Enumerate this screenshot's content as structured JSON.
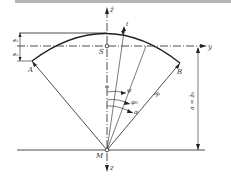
{
  "diagram": {
    "type": "arch-cross-section",
    "colors": {
      "line": "#222222",
      "top_bar": "#b5b5b5",
      "background": "#ffffff"
    },
    "labels": {
      "z_top": "z̄",
      "z_bottom": "z",
      "y_axis": "y",
      "point_A": "A",
      "point_B": "B",
      "point_S": "S",
      "point_M": "M",
      "e1": "e₁",
      "e2": "e₂",
      "t": "t",
      "phi": "φ",
      "phi0": "φ₀",
      "alpha": "α",
      "R": "R",
      "a_dim": "a = z̄₀"
    }
  }
}
